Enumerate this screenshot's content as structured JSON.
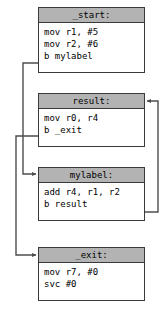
{
  "diagram": {
    "colors": {
      "header_fill": "#b3b3b3",
      "body_fill": "#ffffff",
      "border": "#3a3a3a",
      "edge": "#4d4d4d",
      "text": "#000000"
    },
    "nodes": [
      {
        "id": "start",
        "label": "_start:",
        "lines": [
          "mov r1, #5",
          "mov r2, #6",
          "b mylabel"
        ]
      },
      {
        "id": "result",
        "label": "result:",
        "lines": [
          "mov r0, r4",
          "b _exit"
        ]
      },
      {
        "id": "mylabel",
        "label": "mylabel:",
        "lines": [
          "add r4, r1, r2",
          "b result"
        ]
      },
      {
        "id": "exit",
        "label": "_exit:",
        "lines": [
          "mov r7, #0",
          "svc #0"
        ]
      }
    ],
    "edges": [
      {
        "id": "start-to-mylabel",
        "from": "start",
        "to": "mylabel",
        "routing": "left"
      },
      {
        "id": "mylabel-to-result",
        "from": "mylabel",
        "to": "result",
        "routing": "right"
      },
      {
        "id": "result-to-exit",
        "from": "result",
        "to": "exit",
        "routing": "left"
      }
    ]
  }
}
